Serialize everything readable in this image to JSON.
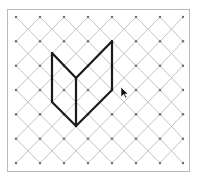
{
  "diagram": {
    "type": "isometric-dot-grid-figure",
    "frame": {
      "x": 7.5,
      "y": 9.5,
      "width": 182,
      "height": 162,
      "stroke": "#b9b9b9"
    },
    "grid": {
      "columns": [
        16,
        40,
        64,
        88,
        112,
        136,
        160,
        183
      ],
      "rows": [
        17,
        41.3,
        65.7,
        90,
        114.3,
        138.7,
        163
      ],
      "dot_color": "#6a6a6a",
      "line_color": "#c4c4c4"
    },
    "figure": {
      "stroke": "#1a1a1a",
      "stroke_width": 2.2,
      "segments": [
        {
          "from": [
            52,
            53
          ],
          "to": [
            52,
            102
          ]
        },
        {
          "from": [
            52,
            102
          ],
          "to": [
            76,
            126
          ]
        },
        {
          "from": [
            76,
            78
          ],
          "to": [
            76,
            126
          ]
        },
        {
          "from": [
            52,
            53
          ],
          "to": [
            76,
            78
          ]
        },
        {
          "from": [
            76,
            78
          ],
          "to": [
            112,
            41.3
          ]
        },
        {
          "from": [
            112,
            41.3
          ],
          "to": [
            112,
            90
          ]
        },
        {
          "from": [
            112,
            90
          ],
          "to": [
            76,
            126
          ]
        }
      ]
    },
    "cursor": {
      "x": 121,
      "y": 87,
      "icon": "mouse-pointer-icon"
    }
  }
}
